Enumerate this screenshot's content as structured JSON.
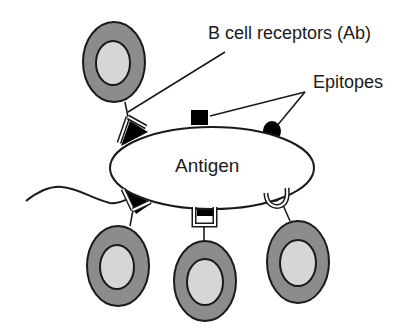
{
  "diagram": {
    "type": "immunology-schematic",
    "antigen": {
      "label": "Antigen"
    },
    "labels": {
      "receptors": "B cell receptors (Ab)",
      "epitopes": "Epitopes"
    },
    "b_cells": [
      {
        "id": "top-left",
        "epitope_shape": "triangle"
      },
      {
        "id": "bottom-left",
        "epitope_shape": "triangle"
      },
      {
        "id": "bottom-center",
        "epitope_shape": "square"
      },
      {
        "id": "bottom-right",
        "epitope_shape": "round"
      }
    ],
    "epitopes": [
      {
        "shape": "triangle",
        "position": "upper-left",
        "bound": true
      },
      {
        "shape": "square",
        "position": "top",
        "bound": false
      },
      {
        "shape": "round",
        "position": "upper-right",
        "bound": false
      },
      {
        "shape": "triangle",
        "position": "lower-left",
        "bound": true
      },
      {
        "shape": "square",
        "position": "bottom",
        "bound": true
      },
      {
        "shape": "round",
        "position": "lower-right",
        "bound": true
      }
    ],
    "colors": {
      "cell_outer": "#8c8c8c",
      "cell_inner": "#d6d6d6",
      "outline": "#1a1a1a",
      "epitope": "#000000",
      "background": "#ffffff"
    }
  }
}
